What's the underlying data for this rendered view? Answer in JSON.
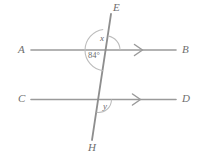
{
  "figure": {
    "type": "geometry-diagram",
    "background_color": "#ffffff",
    "line_color": "#9a9a9a",
    "label_color": "#6e6e6e",
    "arc_color": "#b5b5b5",
    "width": 203,
    "height": 159
  },
  "points": [
    {
      "name": "E",
      "label": "E",
      "x": 113,
      "y": 9,
      "role": "transversal-top-endpoint"
    },
    {
      "name": "A",
      "label": "A",
      "x": 22,
      "y": 50,
      "role": "line-ab-left-endpoint"
    },
    {
      "name": "B",
      "label": "B",
      "x": 185,
      "y": 50,
      "role": "line-ab-right-endpoint"
    },
    {
      "name": "C",
      "label": "C",
      "x": 22,
      "y": 100,
      "role": "line-cd-left-endpoint"
    },
    {
      "name": "D",
      "label": "D",
      "x": 185,
      "y": 100,
      "role": "line-cd-right-endpoint"
    },
    {
      "name": "H",
      "label": "H",
      "x": 90,
      "y": 148,
      "role": "transversal-bottom-endpoint"
    }
  ],
  "lines": [
    {
      "name": "line-ab",
      "from": "A",
      "to": "B",
      "x1": 31,
      "y1": 50,
      "x2": 176,
      "y2": 50,
      "parallel_marker": ">",
      "marker_x": 140,
      "marker_y": 50
    },
    {
      "name": "line-cd",
      "from": "C",
      "to": "D",
      "x1": 31,
      "y1": 99.5,
      "x2": 176,
      "y2": 99.5,
      "parallel_marker": ">",
      "marker_x": 138,
      "marker_y": 99.5
    },
    {
      "name": "transversal-eh",
      "from": "E",
      "to": "H",
      "x1": 111,
      "y1": 14,
      "x2": 92,
      "y2": 140,
      "parallel_marker": "",
      "marker_x": 0,
      "marker_y": 0
    }
  ],
  "intersections": [
    {
      "name": "upper-intersection",
      "x": 106,
      "y": 50,
      "on_lines": "AB and EH"
    },
    {
      "name": "lower-intersection",
      "x": 98.5,
      "y": 99.5,
      "on_lines": "CD and EH"
    }
  ],
  "angles": [
    {
      "name": "angle-x",
      "label": "x",
      "value_text": "x",
      "is_numeric": false,
      "vertex": "upper-intersection",
      "position": "above line AB, right of transversal",
      "label_x": 98,
      "label_y": 37,
      "arc_radius": 14
    },
    {
      "name": "angle-84",
      "label": "84°",
      "value_text": "84°",
      "is_numeric": true,
      "vertex": "upper-intersection",
      "position": "below line AB, left of transversal",
      "label_x": 87,
      "label_y": 52,
      "arc_radius": 21
    },
    {
      "name": "angle-y",
      "label": "y",
      "value_text": "y",
      "is_numeric": false,
      "vertex": "lower-intersection",
      "position": "below line CD, right of transversal",
      "label_x": 103,
      "label_y": 103,
      "arc_radius": 13
    }
  ]
}
